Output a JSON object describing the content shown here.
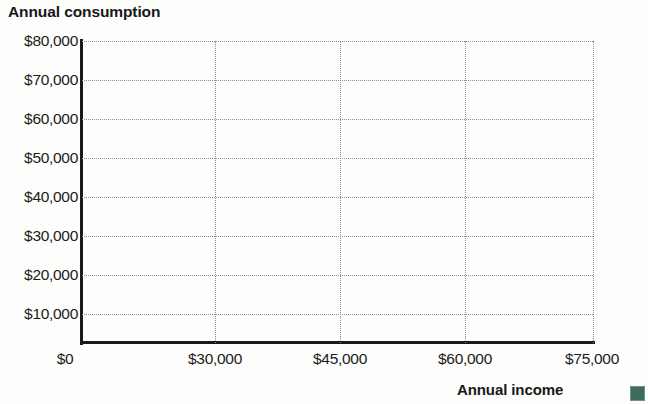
{
  "chart_data": {
    "type": "scatter",
    "title": "Annual consumption",
    "xlabel": "Annual income",
    "ylabel": "Annual consumption",
    "xlim": [
      0,
      75000
    ],
    "ylim": [
      0,
      80000
    ],
    "grid": true,
    "legend": null,
    "series": [],
    "values": [],
    "x": [],
    "note": "Blank axes template - no data points plotted",
    "x_ticks": [
      {
        "value": 0,
        "label": "$0",
        "px": 65
      },
      {
        "value": 30000,
        "label": "$30,000",
        "px": 215
      },
      {
        "value": 45000,
        "label": "$45,000",
        "px": 340
      },
      {
        "value": 60000,
        "label": "$60,000",
        "px": 465
      },
      {
        "value": 75000,
        "label": "$75,000",
        "px": 592
      }
    ],
    "y_ticks": [
      {
        "value": 80000,
        "label": "$80,000",
        "px": 41
      },
      {
        "value": 70000,
        "label": "$70,000",
        "px": 80
      },
      {
        "value": 60000,
        "label": "$60,000",
        "px": 119
      },
      {
        "value": 50000,
        "label": "$50,000",
        "px": 158
      },
      {
        "value": 40000,
        "label": "$40,000",
        "px": 197
      },
      {
        "value": 30000,
        "label": "$30,000",
        "px": 236
      },
      {
        "value": 20000,
        "label": "$20,000",
        "px": 275
      },
      {
        "value": 10000,
        "label": "$10,000",
        "px": 314
      }
    ],
    "vertical_gridlines_px": [
      215,
      340,
      465,
      593
    ],
    "colors": {
      "axis": "#1a1a1a",
      "grid": "#8e8e8e",
      "text": "#1b1b1b",
      "marker": "#3d6b60",
      "background": "#fdfdfb"
    }
  }
}
